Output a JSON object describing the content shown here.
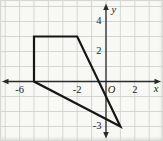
{
  "chart_data": {
    "type": "line",
    "title": "",
    "xlabel": "x",
    "ylabel": "y",
    "origin_label": "O",
    "grid": true,
    "xlim": [
      -7,
      4
    ],
    "ylim": [
      -4,
      5
    ],
    "x_ticks": [
      {
        "value": -6,
        "label": "-6"
      },
      {
        "value": -2,
        "label": "-2"
      },
      {
        "value": 2,
        "label": "2"
      }
    ],
    "y_ticks": [
      {
        "value": 4,
        "label": "4"
      },
      {
        "value": 2,
        "label": "2"
      },
      {
        "value": -3,
        "label": "-3"
      }
    ],
    "series": [
      {
        "name": "quadrilateral",
        "closed": true,
        "points": [
          [
            -5,
            3
          ],
          [
            -2,
            3
          ],
          [
            1,
            -3
          ],
          [
            -5,
            0
          ]
        ]
      }
    ],
    "colors": {
      "polygon_stroke": "#161616",
      "axis": "#2a2a2a",
      "grid": "#c9cac7",
      "paper": "#f8f8f5",
      "label": "#1b1b1b"
    }
  }
}
